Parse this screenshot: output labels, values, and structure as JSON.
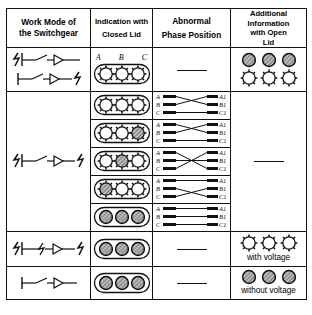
{
  "table": {
    "headers": [
      {
        "id": "work-mode",
        "line1": "Work Mode of",
        "line2": "the Switchgear"
      },
      {
        "id": "indication-closed-lid",
        "line1": "Indication with",
        "line2": "Closed Lid"
      },
      {
        "id": "abnormal-phase-position",
        "line1": "Abnormal",
        "line2": "Phase Position"
      },
      {
        "id": "additional-info-open-lid",
        "line1": "Additional",
        "line2": "Information",
        "line3": "with Open",
        "line4": "Lid"
      }
    ],
    "phase_labels_left": [
      "A",
      "B",
      "C"
    ],
    "phase_labels_right": [
      "A1",
      "B1",
      "C1"
    ],
    "indicator_labels": [
      "A",
      "B",
      "C"
    ],
    "dash": "—",
    "rows": [
      {
        "id": "row-1",
        "work_mode": "two-switch-symbols",
        "indicator": {
          "show_abc": true,
          "states": [
            "gear",
            "gear",
            "gear"
          ]
        },
        "phase": "none",
        "open_lid": {
          "type": "double",
          "top": [
            "shaded",
            "shaded",
            "shaded"
          ],
          "bottom": [
            "gear",
            "gear",
            "gear"
          ],
          "caption": ""
        }
      },
      {
        "id": "row-2",
        "work_mode": "",
        "indicator": {
          "show_abc": false,
          "states": [
            "gear",
            "gear",
            "gear"
          ]
        },
        "phase": "cross-ab",
        "open_lid": null
      },
      {
        "id": "row-3",
        "work_mode": "",
        "indicator": {
          "show_abc": false,
          "states": [
            "gear",
            "gear",
            "shaded"
          ]
        },
        "phase": "cross-ab",
        "open_lid": null
      },
      {
        "id": "row-4",
        "work_mode": "",
        "indicator": {
          "show_abc": false,
          "states": [
            "gear",
            "shaded",
            "gear"
          ]
        },
        "phase": "cross-ac",
        "open_lid": null
      },
      {
        "id": "row-5",
        "work_mode": "",
        "indicator": {
          "show_abc": false,
          "states": [
            "shaded",
            "gear",
            "gear"
          ]
        },
        "phase": "cross-bc",
        "open_lid": null
      },
      {
        "id": "row-6",
        "work_mode": "",
        "indicator": {
          "show_abc": false,
          "states": [
            "shaded",
            "shaded",
            "shaded"
          ]
        },
        "phase": "straight",
        "open_lid": null
      },
      {
        "id": "row-7",
        "work_mode": "energized-both-ends-symbol",
        "indicator": {
          "show_abc": false,
          "states": [
            "shaded",
            "shaded",
            "shaded"
          ]
        },
        "phase": "none",
        "open_lid": {
          "type": "single",
          "top": [
            "gear",
            "gear",
            "gear"
          ],
          "caption": "with voltage"
        }
      },
      {
        "id": "row-8",
        "work_mode": "open-switch-symbol",
        "indicator": {
          "show_abc": false,
          "states": [
            "shaded",
            "shaded",
            "shaded"
          ]
        },
        "phase": "none",
        "open_lid": {
          "type": "single",
          "top": [
            "shaded",
            "shaded",
            "shaded"
          ],
          "caption": "without voltage"
        }
      }
    ],
    "middle_block": {
      "work_mode_symbol": "energized-both-ends-symbol",
      "phase_dash_spans": false
    }
  },
  "colors": {
    "line": "#111111",
    "shade": "#9a9a9a",
    "background": "#ffffff"
  }
}
